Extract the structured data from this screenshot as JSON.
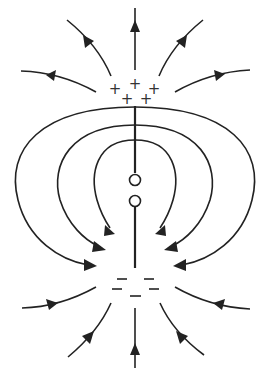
{
  "diagram": {
    "type": "dipole-antenna-electric-field",
    "stroke_color": "#222222",
    "background": "#ffffff",
    "charges": {
      "top": {
        "symbol": "+",
        "count": 5,
        "sign": "positive"
      },
      "bottom": {
        "symbol": "−",
        "count": 5,
        "sign": "negative"
      }
    },
    "field_lines": {
      "radiating_from_top": 5,
      "converging_to_bottom": 5,
      "closed_loops_left": 3,
      "closed_loops_right": 3
    },
    "antenna": {
      "segments": 2,
      "feed_gap_terminals": 2
    }
  },
  "labels": {
    "plus": "+",
    "minus": "–"
  }
}
